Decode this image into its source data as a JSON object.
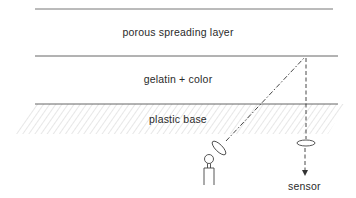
{
  "diagram": {
    "type": "cross-section",
    "layers": [
      {
        "id": "porous",
        "label": "porous spreading layer"
      },
      {
        "id": "gelatin",
        "label": "gelatin + color"
      },
      {
        "id": "plastic",
        "label": "plastic base"
      }
    ],
    "components": {
      "light_source": "lamp-icon",
      "emitter_lens": "lens-icon",
      "detector_lens": "lens-icon",
      "sensor_label": "sensor"
    },
    "colors": {
      "line": "#555555",
      "hatch": "#d4d4d4",
      "text": "#2a2a2a"
    }
  }
}
